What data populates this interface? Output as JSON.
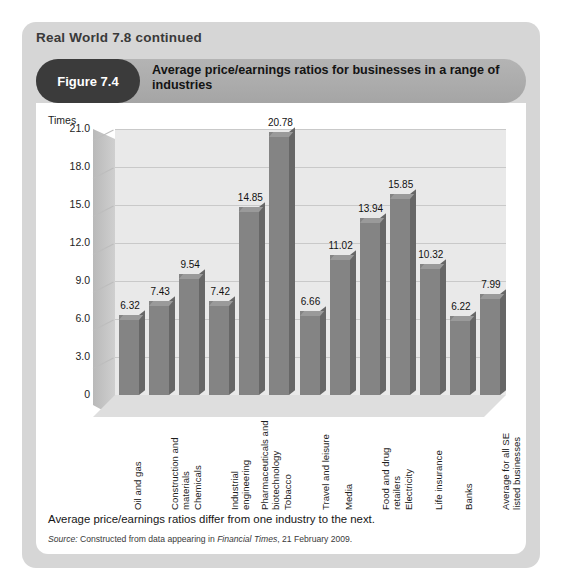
{
  "page": {
    "section_title": "Real World 7.8 continued",
    "figure_badge": "Figure 7.4",
    "figure_title": "Average price/earnings ratios for businesses in a range of industries",
    "caption": "Average price/earnings ratios differ from one industry to the next.",
    "source_prefix": "Source:",
    "source_text_1": "Constructed from data appearing in",
    "source_publication": "Financial Times",
    "source_text_2": ", 21 February 2009."
  },
  "colors": {
    "outer_panel": "#d6d6d6",
    "header_bar": "#ababab",
    "badge": "#3b3b3b",
    "plot_background": "#e9e9e9",
    "bar_front": "#848484",
    "bar_side": "#676767",
    "gridline": "#c9c9c9"
  },
  "chart_data": {
    "type": "bar",
    "title": "Average price/earnings ratios for businesses in a range of industries",
    "xlabel": "",
    "ylabel": "Times",
    "ylim": [
      0,
      21
    ],
    "yticks": [
      "0",
      "3.0",
      "6.0",
      "9.0",
      "12.0",
      "15.0",
      "18.0",
      "21.0"
    ],
    "ytick_values": [
      0,
      3,
      6,
      9,
      12,
      15,
      18,
      21
    ],
    "grid": true,
    "legend": false,
    "categories": [
      "Oil and gas",
      "Construction and materials",
      "Chemicals",
      "Industrial engineering",
      "Pharmaceuticals and biotechnology",
      "Tobacco",
      "Travel and leisure",
      "Media",
      "Food and drug retailers",
      "Electricity",
      "Life insurance",
      "Banks",
      "Average for all SE listed businesses"
    ],
    "values": [
      6.32,
      7.43,
      9.54,
      7.42,
      14.85,
      20.78,
      6.66,
      11.02,
      13.94,
      15.85,
      10.32,
      6.22,
      7.99
    ],
    "value_labels": [
      "6.32",
      "7.43",
      "9.54",
      "7.42",
      "14.85",
      "20.78",
      "6.66",
      "11.02",
      "13.94",
      "15.85",
      "10.32",
      "6.22",
      "7.99"
    ]
  }
}
